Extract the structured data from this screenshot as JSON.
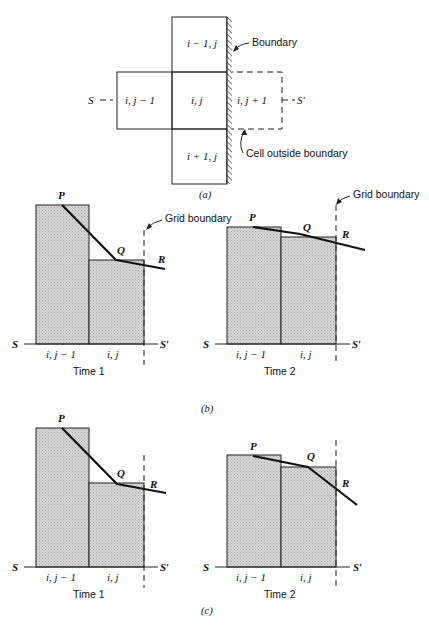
{
  "panel_a": {
    "caption": "(a)",
    "cells": {
      "top": "i − 1, j",
      "left": "i, j − 1",
      "center": "i, j",
      "right_outside": "i, j + 1",
      "bottom": "i + 1, j"
    },
    "left_end": "S",
    "right_end": "S′",
    "boundary_label": "Boundary",
    "outside_label": "Cell outside boundary"
  },
  "panel_b": {
    "caption": "(b)",
    "time1": {
      "title": "Time 1",
      "cells": [
        "i, j − 1",
        "i, j"
      ],
      "left_end": "S",
      "right_end": "S′",
      "points": [
        "P",
        "Q",
        "R"
      ]
    },
    "time2": {
      "title": "Time 2",
      "cells": [
        "i, j − 1",
        "i, j"
      ],
      "left_end": "S",
      "right_end": "S′",
      "points": [
        "P",
        "Q",
        "R"
      ],
      "grid_boundary_label": "Grid boundary"
    },
    "grid_boundary_label": "Grid boundary"
  },
  "panel_c": {
    "caption": "(c)",
    "time1": {
      "title": "Time 1",
      "cells": [
        "i, j − 1",
        "i, j"
      ],
      "left_end": "S",
      "right_end": "S′",
      "points": [
        "P",
        "Q",
        "R"
      ]
    },
    "time2": {
      "title": "Time 2",
      "cells": [
        "i, j − 1",
        "i, j"
      ],
      "left_end": "S",
      "right_end": "S′",
      "points": [
        "P",
        "Q",
        "R"
      ]
    }
  }
}
